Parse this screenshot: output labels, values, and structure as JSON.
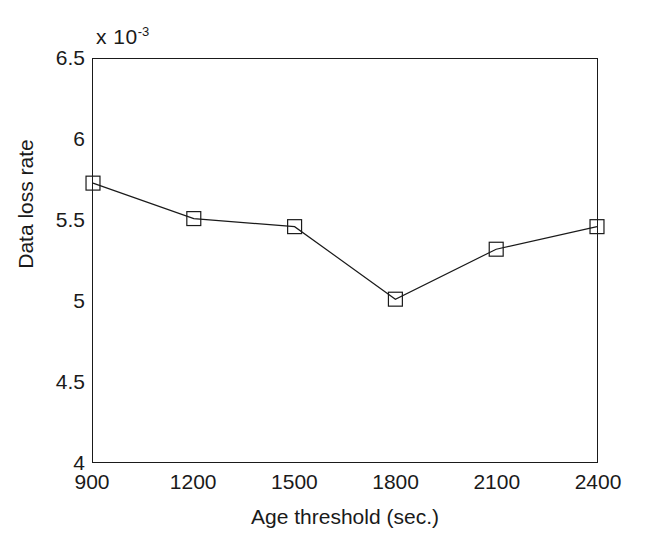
{
  "chart_data": {
    "type": "line",
    "title": "",
    "xlabel": "Age threshold (sec.)",
    "ylabel": "Data loss rate",
    "y_multiplier_prefix": "x 10",
    "y_multiplier_exponent": "-3",
    "y_multiplier_text": "x 10^-3",
    "x": [
      900,
      1200,
      1500,
      1800,
      2100,
      2400
    ],
    "values": [
      5.73,
      5.51,
      5.46,
      5.01,
      5.32,
      5.46
    ],
    "series": [
      {
        "name": "Data loss rate",
        "values": [
          5.73,
          5.51,
          5.46,
          5.01,
          5.32,
          5.46
        ],
        "marker": "square",
        "line_style": "solid",
        "color": "#1a1a1a"
      }
    ],
    "xlim": [
      900,
      2400
    ],
    "ylim": [
      4,
      6.5
    ],
    "xticks": [
      900,
      1200,
      1500,
      1800,
      2100,
      2400
    ],
    "xtick_labels": [
      "900",
      "1200",
      "1500",
      "1800",
      "2100",
      "2400"
    ],
    "yticks": [
      4,
      4.5,
      5,
      5.5,
      6,
      6.5
    ],
    "ytick_labels": [
      "4",
      "4.5",
      "5",
      "5.5",
      "6",
      "6.5"
    ],
    "grid": false,
    "legend": "none",
    "background_color": "#ffffff",
    "axis_color": "#1a1a1a"
  }
}
